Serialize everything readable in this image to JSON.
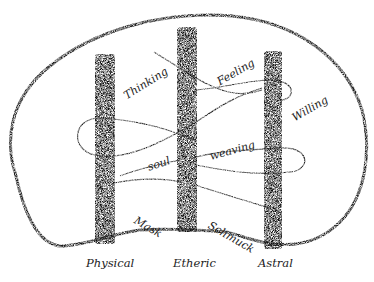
{
  "diagram": {
    "kind": "hand-drawn sketch",
    "outline": "head-shaped enclosing curve",
    "pillars": [
      {
        "id": "physical",
        "label": "Physical"
      },
      {
        "id": "etheric",
        "label": "Etheric"
      },
      {
        "id": "astral",
        "label": "Astral"
      }
    ],
    "words": {
      "thinking": "Thinking",
      "feeling": "Feeling",
      "willing": "Willing",
      "soul": "soul",
      "weaving": "weaving",
      "mask": "Mask",
      "schmuck": "Schmuck"
    },
    "colors": {
      "ink": "#1a1a1a",
      "paper": "#ffffff"
    }
  }
}
